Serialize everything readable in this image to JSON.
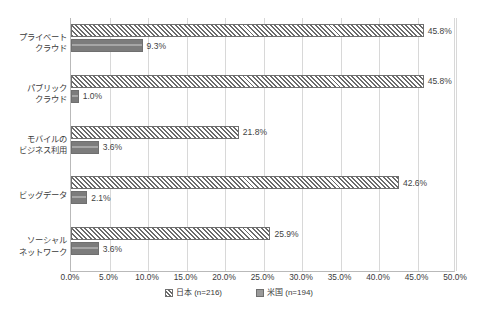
{
  "chart_data": {
    "type": "bar",
    "orientation": "horizontal",
    "title": "",
    "xlabel": "",
    "ylabel": "",
    "xlim": [
      0,
      50
    ],
    "xtick_labels": [
      "0.0%",
      "5.0%",
      "10.0%",
      "15.0%",
      "20.0%",
      "25.0%",
      "30.0%",
      "35.0%",
      "40.0%",
      "45.0%",
      "50.0%"
    ],
    "xticks": [
      0,
      5,
      10,
      15,
      20,
      25,
      30,
      35,
      40,
      45,
      50
    ],
    "grid": true,
    "legend_position": "bottom",
    "categories": [
      "プライベートクラウド",
      "パブリッククラウド",
      "モバイルのビジネス利用",
      "ビッグデータ",
      "ソーシャルネットワーク"
    ],
    "category_lines": [
      [
        "プライベート",
        "クラウド"
      ],
      [
        "パブリック",
        "クラウド"
      ],
      [
        "モバイルの",
        "ビジネス利用"
      ],
      [
        "ビッグデータ"
      ],
      [
        "ソーシャル",
        "ネットワーク"
      ]
    ],
    "series": [
      {
        "name": "日本 (n=216)",
        "pattern": "diagonal-hatch",
        "values": [
          45.8,
          45.8,
          21.8,
          42.6,
          25.9
        ],
        "data_labels": [
          "45.8%",
          "45.8%",
          "21.8%",
          "42.6%",
          "25.9%"
        ]
      },
      {
        "name": "米国 (n=194)",
        "pattern": "solid-gray",
        "values": [
          9.3,
          1.0,
          3.6,
          2.1,
          3.6
        ],
        "data_labels": [
          "9.3%",
          "1.0%",
          "3.6%",
          "2.1%",
          "3.6%"
        ]
      }
    ]
  },
  "legend": {
    "items": [
      {
        "label": "日本 (n=216)",
        "swatch": "jp"
      },
      {
        "label": "米国 (n=194)",
        "swatch": "us"
      }
    ]
  },
  "colors": {
    "series_jp_fill": "#f2f2f2",
    "series_jp_hatch": "#6b6b6b",
    "series_us_fill": "#808080",
    "bar_border": "#6f6f6f",
    "gridline": "#d8d8d8",
    "axis_line": "#b9b9b9",
    "text": "#3a3a3a",
    "background": "#ffffff"
  }
}
